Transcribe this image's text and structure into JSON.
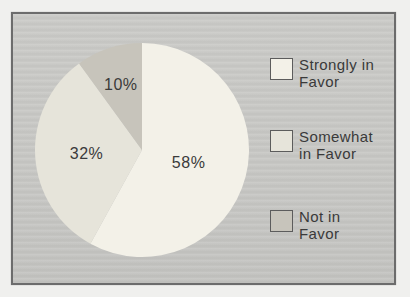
{
  "chart_data": {
    "type": "pie",
    "title": "",
    "legend_position": "right",
    "direction": "clockwise",
    "start_angle_deg": 0,
    "label_color": "#3a3a3a",
    "slices": [
      {
        "label": "Strongly in Favor",
        "value": 58,
        "display": "58%",
        "color": "#f3f1e8",
        "label_r": 0.45
      },
      {
        "label": "Somewhat in Favor",
        "value": 32,
        "display": "32%",
        "color": "#e6e4da",
        "label_r": 0.52
      },
      {
        "label": "Not in Favor",
        "value": 10,
        "display": "10%",
        "color": "#c7c4bb",
        "label_r": 0.64
      }
    ]
  },
  "legend": {
    "items": [
      {
        "line1": "Strongly in",
        "line2": "Favor",
        "color": "#f3f1e8"
      },
      {
        "line1": "Somewhat",
        "line2": "in Favor",
        "color": "#e6e4da"
      },
      {
        "line1": "Not in",
        "line2": "Favor",
        "color": "#c7c4bb"
      }
    ]
  },
  "colors": {
    "page_bg": "#f0f0ee",
    "panel_bg": "#c8c8c5",
    "frame_border": "#6c6c6c",
    "text": "#3a3a3a",
    "swatch_border": "#5c5c5c"
  }
}
